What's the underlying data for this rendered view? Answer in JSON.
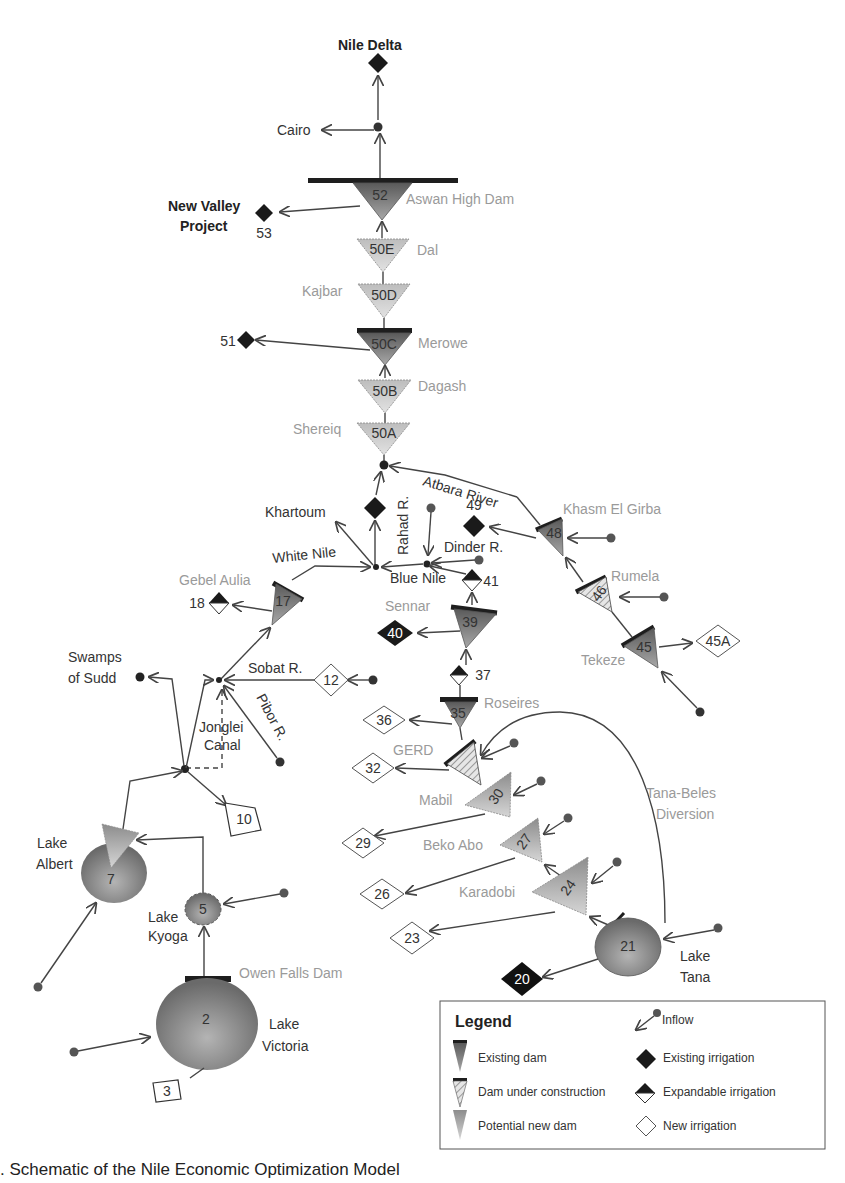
{
  "diagram": {
    "labels": {
      "nile_delta": "Nile Delta",
      "cairo": "Cairo",
      "new_valley": [
        "New Valley",
        "Project"
      ],
      "aswan": "Aswan High Dam",
      "dal": "Dal",
      "kajbar": "Kajbar",
      "merowe": "Merowe",
      "dagash": "Dagash",
      "shereiq": "Shereiq",
      "atbara_river": "Atbara River",
      "khartoum": "Khartoum",
      "rahad": "Rahad R.",
      "dinder": "Dinder R.",
      "blue_nile": "Blue Nile",
      "white_nile": "White Nile",
      "khasm": "Khasm El Girba",
      "rumela": "Rumela",
      "tekeze": "Tekeze",
      "gebel_aulia": "Gebel Aulia",
      "sennar": "Sennar",
      "sobat": "Sobat R.",
      "pibor": "Pibor R.",
      "swamps": [
        "Swamps",
        "of Sudd"
      ],
      "jonglei": [
        "Jonglei",
        "Canal"
      ],
      "roseires": "Roseires",
      "gerd": "GERD",
      "mabil": "Mabil",
      "beko_abo": "Beko Abo",
      "karadobi": "Karadobi",
      "tana_beles": [
        "Tana-Beles",
        "Diversion"
      ],
      "lake_albert": [
        "Lake",
        "Albert"
      ],
      "lake_kyoga": [
        "Lake",
        "Kyoga"
      ],
      "owen_falls": "Owen Falls Dam",
      "lake_victoria": [
        "Lake",
        "Victoria"
      ],
      "lake_tana": [
        "Lake",
        "Tana"
      ]
    },
    "node_ids": {
      "n52": "52",
      "n53": "53",
      "n50E": "50E",
      "n50D": "50D",
      "n50C": "50C",
      "n51": "51",
      "n50B": "50B",
      "n50A": "50A",
      "n49": "49",
      "n48": "48",
      "n46": "46",
      "n45": "45",
      "n45A": "45A",
      "n41": "41",
      "n40": "40",
      "n39": "39",
      "n37": "37",
      "n36": "36",
      "n35": "35",
      "n32": "32",
      "n30": "30",
      "n29": "29",
      "n27": "27",
      "n26": "26",
      "n24": "24",
      "n23": "23",
      "n21": "21",
      "n20": "20",
      "n18": "18",
      "n17": "17",
      "n12": "12",
      "n10": "10",
      "n7": "7",
      "n5": "5",
      "n2": "2",
      "n3": "3"
    }
  },
  "legend": {
    "title": "Legend",
    "items": {
      "inflow": "Inflow",
      "existing_dam": "Existing dam",
      "existing_irrigation": "Existing irrigation",
      "dam_under_construction": "Dam under construction",
      "expandable_irrigation": "Expandable irrigation",
      "potential_new_dam": "Potential new dam",
      "new_irrigation": "New irrigation"
    }
  },
  "colors": {
    "existing_dam": "#6e6e6e",
    "potential_dam": "#b5b5b5",
    "dam_crest": "#1e1e1e",
    "lake": "#8a8a8a",
    "grey_label": "#9a9a9a"
  },
  "caption": ". Schematic of the Nile Economic Optimization Model"
}
